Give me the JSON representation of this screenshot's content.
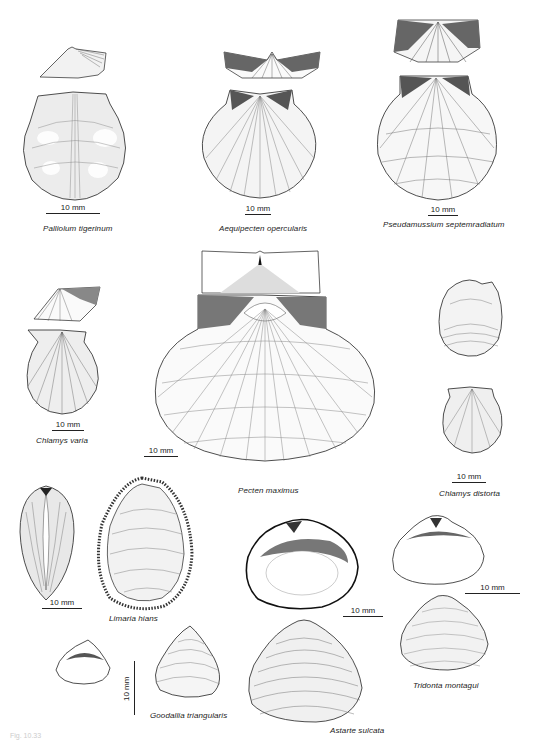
{
  "figure": {
    "figure_number": "Fig. 10.33",
    "scale_label": "10 mm",
    "species": [
      {
        "name": "Palliolum tigerinum",
        "scale": "10 mm"
      },
      {
        "name": "Aequipecten opercularis",
        "scale": "10 mm"
      },
      {
        "name": "Pseudamussium septemradiatum",
        "scale": "10 mm"
      },
      {
        "name": "Chlamys varia",
        "scale": "10 mm"
      },
      {
        "name": "Pecten maximus",
        "scale": "10 mm"
      },
      {
        "name": "Chlamys distorta",
        "scale": "10 mm"
      },
      {
        "name": "Limaria hians",
        "scale": "10 mm"
      },
      {
        "name": "Astarte sulcata",
        "scale": "10 mm"
      },
      {
        "name": "Tridonta montagui",
        "scale": "10 mm"
      },
      {
        "name": "Goodallia triangularis",
        "scale": "10 mm"
      }
    ]
  },
  "colors": {
    "ink": "#222222",
    "paper": "#ffffff",
    "shade": "#888888"
  }
}
